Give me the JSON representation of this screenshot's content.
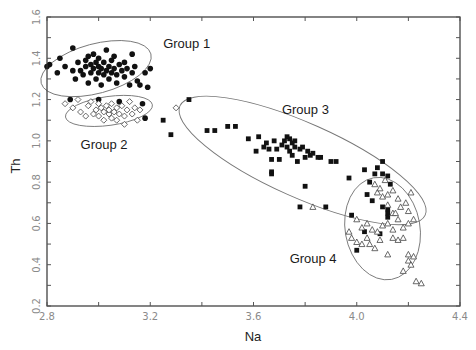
{
  "chart_data": {
    "type": "scatter",
    "title": "",
    "xlabel": "Na",
    "ylabel": "Th",
    "xlim": [
      2.8,
      4.4
    ],
    "ylim": [
      0.2,
      1.6
    ],
    "xticks": [
      "2.8",
      "3.2",
      "3.6",
      "4.0",
      "4.4"
    ],
    "yticks": [
      "0.2",
      "0.4",
      "0.6",
      "0.8",
      "1.0",
      "1.2",
      "1.4",
      "1.6"
    ],
    "grid": false,
    "legend": "none (group labels annotated in plot)",
    "annotations": [
      {
        "text": "Group 1",
        "x": 3.25,
        "y": 1.45
      },
      {
        "text": "Group 2",
        "x": 2.93,
        "y": 0.96
      },
      {
        "text": "Group 3",
        "x": 3.71,
        "y": 1.13
      },
      {
        "text": "Group 4",
        "x": 3.74,
        "y": 0.41
      }
    ],
    "ellipses": [
      {
        "group": "Group 1",
        "cx": 2.99,
        "cy": 1.35,
        "rx": 0.22,
        "ry": 0.12,
        "angle": -15
      },
      {
        "group": "Group 2",
        "cx": 3.04,
        "cy": 1.145,
        "rx": 0.17,
        "ry": 0.07,
        "angle": -8
      },
      {
        "group": "Group 3",
        "cx": 3.79,
        "cy": 0.905,
        "rx": 0.52,
        "ry": 0.18,
        "angle": 24
      },
      {
        "group": "Group 4",
        "cx": 4.1,
        "cy": 0.575,
        "rx": 0.145,
        "ry": 0.25,
        "angle": -10
      }
    ],
    "series": [
      {
        "name": "Group 1",
        "marker": "filled-circle",
        "points": [
          [
            2.8,
            1.36
          ],
          [
            2.81,
            1.37
          ],
          [
            2.84,
            1.33
          ],
          [
            2.85,
            1.4
          ],
          [
            2.87,
            1.36
          ],
          [
            2.9,
            1.45
          ],
          [
            2.9,
            1.34
          ],
          [
            2.91,
            1.3
          ],
          [
            2.92,
            1.38
          ],
          [
            2.93,
            1.34
          ],
          [
            2.94,
            1.32
          ],
          [
            2.95,
            1.39
          ],
          [
            2.95,
            1.36
          ],
          [
            2.96,
            1.28
          ],
          [
            2.96,
            1.41
          ],
          [
            2.97,
            1.33
          ],
          [
            2.97,
            1.37
          ],
          [
            2.98,
            1.35
          ],
          [
            2.98,
            1.42
          ],
          [
            2.99,
            1.3
          ],
          [
            2.99,
            1.38
          ],
          [
            3.0,
            1.33
          ],
          [
            3.0,
            1.36
          ],
          [
            3.0,
            1.4
          ],
          [
            3.01,
            1.27
          ],
          [
            3.01,
            1.35
          ],
          [
            3.02,
            1.38
          ],
          [
            3.02,
            1.32
          ],
          [
            3.03,
            1.44
          ],
          [
            3.03,
            1.34
          ],
          [
            3.04,
            1.36
          ],
          [
            3.04,
            1.3
          ],
          [
            3.05,
            1.39
          ],
          [
            3.05,
            1.33
          ],
          [
            3.06,
            1.35
          ],
          [
            3.06,
            1.41
          ],
          [
            3.07,
            1.32
          ],
          [
            3.07,
            1.28
          ],
          [
            3.08,
            1.37
          ],
          [
            3.09,
            1.34
          ],
          [
            3.1,
            1.38
          ],
          [
            3.1,
            1.31
          ],
          [
            3.11,
            1.35
          ],
          [
            3.12,
            1.27
          ],
          [
            3.13,
            1.42
          ],
          [
            3.13,
            1.33
          ],
          [
            3.14,
            1.36
          ],
          [
            3.15,
            1.29
          ],
          [
            3.16,
            1.27
          ],
          [
            3.18,
            1.33
          ],
          [
            3.19,
            1.26
          ],
          [
            3.2,
            1.35
          ],
          [
            2.89,
            1.2
          ],
          [
            3.0,
            1.2
          ],
          [
            3.08,
            1.19
          ],
          [
            3.17,
            1.18
          ],
          [
            3.18,
            1.11
          ]
        ]
      },
      {
        "name": "Group 2",
        "marker": "open-diamond",
        "points": [
          [
            2.87,
            1.18
          ],
          [
            2.9,
            1.16
          ],
          [
            2.92,
            1.2
          ],
          [
            2.93,
            1.14
          ],
          [
            2.95,
            1.12
          ],
          [
            2.96,
            1.17
          ],
          [
            2.97,
            1.19
          ],
          [
            2.98,
            1.13
          ],
          [
            2.99,
            1.15
          ],
          [
            3.0,
            1.18
          ],
          [
            3.0,
            1.12
          ],
          [
            3.01,
            1.16
          ],
          [
            3.02,
            1.14
          ],
          [
            3.02,
            1.1
          ],
          [
            3.03,
            1.17
          ],
          [
            3.04,
            1.13
          ],
          [
            3.04,
            1.15
          ],
          [
            3.05,
            1.18
          ],
          [
            3.05,
            1.11
          ],
          [
            3.06,
            1.14
          ],
          [
            3.07,
            1.16
          ],
          [
            3.07,
            1.1
          ],
          [
            3.08,
            1.13
          ],
          [
            3.09,
            1.17
          ],
          [
            3.1,
            1.12
          ],
          [
            3.1,
            1.08
          ],
          [
            3.11,
            1.15
          ],
          [
            3.12,
            1.19
          ],
          [
            3.13,
            1.13
          ],
          [
            3.14,
            1.16
          ],
          [
            3.15,
            1.1
          ],
          [
            3.16,
            1.15
          ],
          [
            3.3,
            1.16
          ]
        ]
      },
      {
        "name": "Group 3",
        "marker": "filled-square",
        "points": [
          [
            3.25,
            1.1
          ],
          [
            3.28,
            1.03
          ],
          [
            3.35,
            1.2
          ],
          [
            3.42,
            1.05
          ],
          [
            3.45,
            1.05
          ],
          [
            3.5,
            1.07
          ],
          [
            3.53,
            1.07
          ],
          [
            3.58,
            1.01
          ],
          [
            3.61,
            0.95
          ],
          [
            3.62,
            1.02
          ],
          [
            3.64,
            0.97
          ],
          [
            3.65,
            0.99
          ],
          [
            3.66,
            0.96
          ],
          [
            3.67,
            0.91
          ],
          [
            3.68,
            1.0
          ],
          [
            3.69,
            0.96
          ],
          [
            3.7,
            0.91
          ],
          [
            3.71,
            0.98
          ],
          [
            3.72,
            1.0
          ],
          [
            3.73,
            1.02
          ],
          [
            3.73,
            0.97
          ],
          [
            3.74,
            0.95
          ],
          [
            3.74,
            1.01
          ],
          [
            3.75,
            0.99
          ],
          [
            3.75,
            0.93
          ],
          [
            3.76,
            0.97
          ],
          [
            3.76,
            1.0
          ],
          [
            3.77,
            0.9
          ],
          [
            3.78,
            0.96
          ],
          [
            3.79,
            0.97
          ],
          [
            3.8,
            0.92
          ],
          [
            3.81,
            0.95
          ],
          [
            3.82,
            0.93
          ],
          [
            3.83,
            0.94
          ],
          [
            3.85,
            0.92
          ],
          [
            3.86,
            0.92
          ],
          [
            3.67,
            0.85
          ],
          [
            3.67,
            0.84
          ],
          [
            3.8,
            0.78
          ],
          [
            3.9,
            0.9
          ],
          [
            3.92,
            0.9
          ],
          [
            3.97,
            0.82
          ],
          [
            4.03,
            0.86
          ],
          [
            4.05,
            0.8
          ],
          [
            4.07,
            0.84
          ],
          [
            4.08,
            0.87
          ],
          [
            4.1,
            0.9
          ],
          [
            4.1,
            0.84
          ],
          [
            4.12,
            0.83
          ],
          [
            4.13,
            0.79
          ],
          [
            3.78,
            0.68
          ],
          [
            3.88,
            0.68
          ],
          [
            3.98,
            0.64
          ],
          [
            4.04,
            0.74
          ],
          [
            4.06,
            0.71
          ],
          [
            4.1,
            0.68
          ],
          [
            4.12,
            0.65
          ],
          [
            4.12,
            0.63
          ],
          [
            4.0,
            0.47
          ],
          [
            4.03,
            0.56
          ],
          [
            4.09,
            0.55
          ],
          [
            4.12,
            0.67
          ]
        ]
      },
      {
        "name": "Group 4",
        "marker": "open-triangle",
        "points": [
          [
            3.83,
            0.68
          ],
          [
            4.07,
            0.79
          ],
          [
            4.08,
            0.75
          ],
          [
            4.09,
            0.77
          ],
          [
            4.1,
            0.73
          ],
          [
            4.11,
            0.81
          ],
          [
            4.12,
            0.74
          ],
          [
            4.14,
            0.76
          ],
          [
            4.16,
            0.72
          ],
          [
            4.19,
            0.7
          ],
          [
            4.2,
            0.66
          ],
          [
            4.21,
            0.75
          ],
          [
            4.12,
            0.69
          ],
          [
            4.14,
            0.65
          ],
          [
            4.16,
            0.62
          ],
          [
            4.18,
            0.58
          ],
          [
            4.2,
            0.6
          ],
          [
            4.22,
            0.62
          ],
          [
            4.0,
            0.62
          ],
          [
            4.02,
            0.58
          ],
          [
            4.04,
            0.6
          ],
          [
            4.06,
            0.57
          ],
          [
            4.08,
            0.56
          ],
          [
            4.1,
            0.59
          ],
          [
            4.12,
            0.6
          ],
          [
            4.14,
            0.57
          ],
          [
            3.97,
            0.56
          ],
          [
            3.98,
            0.53
          ],
          [
            4.0,
            0.51
          ],
          [
            4.02,
            0.5
          ],
          [
            4.04,
            0.53
          ],
          [
            4.05,
            0.5
          ],
          [
            4.07,
            0.48
          ],
          [
            4.09,
            0.52
          ],
          [
            4.12,
            0.45
          ],
          [
            4.14,
            0.53
          ],
          [
            4.16,
            0.52
          ],
          [
            4.18,
            0.53
          ],
          [
            4.2,
            0.45
          ],
          [
            4.22,
            0.44
          ],
          [
            4.2,
            0.42
          ],
          [
            4.21,
            0.4
          ],
          [
            4.18,
            0.37
          ],
          [
            4.23,
            0.32
          ],
          [
            4.25,
            0.31
          ],
          [
            4.15,
            0.65
          ],
          [
            4.17,
            0.68
          ]
        ]
      }
    ]
  }
}
